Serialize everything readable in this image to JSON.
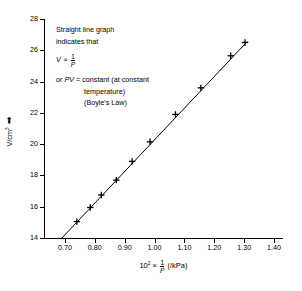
{
  "chart_data": {
    "type": "scatter",
    "title": "",
    "xlabel": "10^2 x 1/P (/kPa)",
    "ylabel": "V/cm^3",
    "xlim": [
      0.63,
      1.43
    ],
    "ylim": [
      14,
      28
    ],
    "grid": false,
    "legend": "none",
    "x_ticks": [
      "0.70",
      "0.80",
      "0.90",
      "1.00",
      "1.10",
      "1.20",
      "1.30",
      "1.40"
    ],
    "x_tick_values": [
      0.7,
      0.8,
      0.9,
      1.0,
      1.1,
      1.2,
      1.3,
      1.4
    ],
    "y_ticks": [
      "14",
      "16",
      "18",
      "20",
      "22",
      "24",
      "26",
      "28"
    ],
    "y_tick_values": [
      14,
      16,
      18,
      20,
      22,
      24,
      26,
      28
    ],
    "x": [
      0.74,
      0.785,
      0.822,
      0.872,
      0.925,
      0.985,
      1.07,
      1.155,
      1.255,
      1.303
    ],
    "values": [
      15.05,
      15.95,
      16.75,
      17.7,
      18.9,
      20.15,
      21.9,
      23.6,
      25.65,
      26.5
    ],
    "marker": "plus",
    "fit_line": {
      "x0": 0.69,
      "y0": 14.0,
      "x1": 1.31,
      "y1": 26.55
    },
    "annotations": [
      "Straight line graph",
      "indicates that",
      "V ∝ 1/P",
      "or PV = constant (at constant",
      "temperature)",
      "(Boyle's Law)"
    ]
  },
  "axes": {
    "y_title_text": "V/cm",
    "y_title_exp": "3",
    "y_title_arrow": "↑",
    "x_title_prefix": "10",
    "x_title_exp": "2",
    "x_title_times": "×",
    "x_frac_num": "1",
    "x_frac_den": "P",
    "x_title_unit": "(/kPa)"
  },
  "annotation": {
    "line1": "Straight line graph",
    "line2": "indicates that",
    "prop_var": "V",
    "prop_sym": "∝",
    "prop_num": "1",
    "prop_den": "P",
    "line4_or": "or",
    "line4_pv": "PV",
    "line4_rest": "= constant (at constant",
    "line5": "temperature)",
    "line6": "(Boyle's Law)"
  },
  "colors": {
    "axis": "#000000",
    "line": "#000000",
    "marker": "#000000",
    "background": "#ffffff"
  }
}
